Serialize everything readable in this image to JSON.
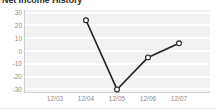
{
  "widget": {
    "title": "Net Income History",
    "background_color": "#ffffff"
  },
  "chart_data": {
    "type": "line",
    "title": "Net Income History",
    "xlabel": "",
    "ylabel": "",
    "categories": [
      "12/03",
      "12/04",
      "12/05",
      "12/06",
      "12/07"
    ],
    "series": [
      {
        "name": "Net Income",
        "values": [
          null,
          24,
          -30,
          -5,
          6
        ]
      }
    ],
    "yticks": [
      "30",
      "20",
      "10",
      "0",
      "-10",
      "-20",
      "-30"
    ],
    "ytick_values": [
      30,
      20,
      10,
      0,
      -10,
      -20,
      -30
    ],
    "ylim": [
      -32,
      32
    ],
    "grid": true,
    "legend": "none",
    "line_color": "#231f20",
    "marker": "open-circle",
    "marker_fill": "#ffffff",
    "plot_background": "#f2f2f2",
    "gridline_color": "#ffffff",
    "axis_color": "#cfcfcf",
    "tick_label_color": "#8a8a8a"
  }
}
